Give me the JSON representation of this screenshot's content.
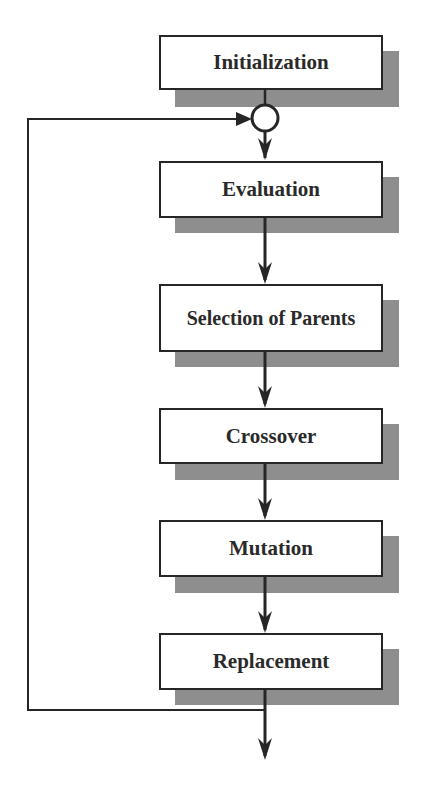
{
  "diagram": {
    "steps": [
      {
        "id": "initialization",
        "label": "Initialization"
      },
      {
        "id": "evaluation",
        "label": "Evaluation"
      },
      {
        "id": "selection",
        "label": "Selection of Parents"
      },
      {
        "id": "crossover",
        "label": "Crossover"
      },
      {
        "id": "mutation",
        "label": "Mutation"
      },
      {
        "id": "replacement",
        "label": "Replacement"
      }
    ],
    "connectors": {
      "merge_node": "junction-circle",
      "feedback_loop": "Replacement -> Evaluation (loop back)",
      "exit": "output arrow below Replacement"
    },
    "colors": {
      "box_fill": "#ffffff",
      "box_border": "#262626",
      "shadow": "#8e8e8e",
      "line": "#262626",
      "text": "#2a2a2a"
    }
  }
}
